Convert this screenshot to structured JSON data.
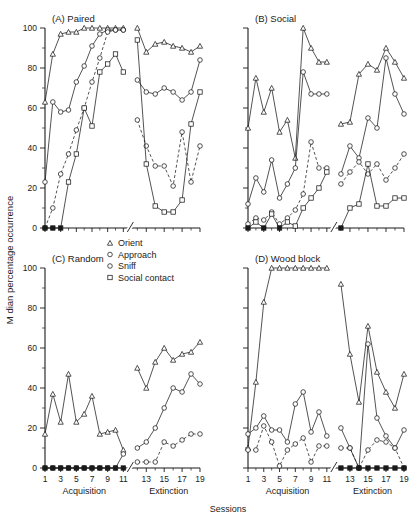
{
  "figure": {
    "y_axis_label": "M dian percentage occurrence",
    "x_axis_label": "Sessions",
    "phase_labels": {
      "acquisition": "Acquisition",
      "extinction": "Extinction"
    },
    "y_ticks": [
      "0",
      "20",
      "40",
      "60",
      "80",
      "100"
    ],
    "x_ticks_acquisition": [
      "1",
      "3",
      "5",
      "7",
      "9",
      "11"
    ],
    "x_ticks_extinction": [
      "13",
      "15",
      "17",
      "19"
    ]
  },
  "legend": {
    "items": [
      {
        "label": "Orient",
        "marker": "triangle",
        "style": "solid"
      },
      {
        "label": "Approach",
        "marker": "circle",
        "style": "solid"
      },
      {
        "label": "Sniff",
        "marker": "circle",
        "style": "solid"
      },
      {
        "label": "Social contact",
        "marker": "square",
        "style": "solid"
      }
    ]
  },
  "panels": {
    "a": {
      "title": "(A) Paired"
    },
    "b": {
      "title": "(B) Social"
    },
    "c": {
      "title": "(C) Random"
    },
    "d": {
      "title": "(D) Wood block"
    }
  },
  "chart_data": [
    {
      "id": "A",
      "type": "line",
      "title": "(A) Paired",
      "xlabel": "Sessions",
      "ylabel": "M dian percentage occurrence",
      "ylim": [
        0,
        100
      ],
      "xlim": [
        1,
        19
      ],
      "grid": false,
      "axis_break_between": [
        11,
        12
      ],
      "phases": {
        "acquisition": [
          1,
          11
        ],
        "extinction": [
          12,
          19
        ]
      },
      "series": [
        {
          "name": "Orient",
          "marker": "triangle",
          "style": "solid",
          "x": [
            1,
            2,
            3,
            4,
            5,
            6,
            7,
            8,
            9,
            10,
            11,
            12,
            13,
            14,
            15,
            16,
            17,
            18,
            19
          ],
          "y": [
            63,
            87,
            97,
            98,
            98,
            100,
            100,
            100,
            100,
            100,
            100,
            100,
            88,
            92,
            93,
            91,
            90,
            88,
            91
          ]
        },
        {
          "name": "Approach",
          "marker": "circle",
          "style": "solid",
          "x": [
            1,
            2,
            3,
            4,
            5,
            6,
            7,
            8,
            9,
            10,
            11,
            12,
            13,
            14,
            15,
            16,
            17,
            18,
            19
          ],
          "y": [
            23,
            63,
            58,
            59,
            73,
            81,
            91,
            97,
            99,
            99,
            99,
            74,
            68,
            67,
            70,
            68,
            64,
            68,
            84
          ]
        },
        {
          "name": "Sniff",
          "marker": "circle",
          "style": "dashed",
          "x": [
            1,
            2,
            3,
            4,
            5,
            6,
            7,
            8,
            9,
            10,
            11,
            12,
            13,
            14,
            15,
            16,
            17,
            18,
            19
          ],
          "y": [
            0,
            10,
            27,
            37,
            49,
            60,
            73,
            85,
            98,
            99,
            99,
            54,
            41,
            31,
            31,
            21,
            48,
            23,
            41
          ]
        },
        {
          "name": "Social contact",
          "marker": "square",
          "style": "solid",
          "x": [
            1,
            2,
            3,
            4,
            5,
            6,
            7,
            8,
            9,
            10,
            11,
            12,
            13,
            14,
            15,
            16,
            17,
            18,
            19
          ],
          "y": [
            0,
            0,
            0,
            23,
            37,
            60,
            51,
            78,
            82,
            87,
            78,
            94,
            32,
            11,
            8,
            8,
            14,
            52,
            68
          ]
        }
      ]
    },
    {
      "id": "B",
      "type": "line",
      "title": "(B) Social",
      "xlabel": "Sessions",
      "ylabel": "M dian percentage occurrence",
      "ylim": [
        0,
        100
      ],
      "xlim": [
        1,
        19
      ],
      "grid": false,
      "axis_break_between": [
        11,
        12
      ],
      "phases": {
        "acquisition": [
          1,
          11
        ],
        "extinction": [
          12,
          19
        ]
      },
      "series": [
        {
          "name": "Orient",
          "marker": "triangle",
          "style": "solid",
          "x": [
            1,
            2,
            3,
            4,
            5,
            6,
            7,
            8,
            9,
            10,
            11,
            12,
            13,
            14,
            15,
            16,
            17,
            18,
            19
          ],
          "y": [
            50,
            75,
            58,
            70,
            48,
            54,
            35,
            100,
            90,
            83,
            83,
            52,
            53,
            77,
            82,
            79,
            90,
            83,
            75
          ]
        },
        {
          "name": "Approach",
          "marker": "circle",
          "style": "solid",
          "x": [
            1,
            2,
            3,
            4,
            5,
            6,
            7,
            8,
            9,
            10,
            11,
            12,
            13,
            14,
            15,
            16,
            17,
            18,
            19
          ],
          "y": [
            12,
            25,
            18,
            34,
            15,
            22,
            30,
            78,
            67,
            67,
            67,
            27,
            41,
            35,
            55,
            50,
            85,
            67,
            57
          ]
        },
        {
          "name": "Sniff",
          "marker": "circle",
          "style": "dashed",
          "x": [
            1,
            2,
            3,
            4,
            5,
            6,
            7,
            8,
            9,
            10,
            11,
            12,
            13,
            14,
            15,
            16,
            17,
            18,
            19
          ],
          "y": [
            2,
            5,
            4,
            8,
            2,
            5,
            9,
            17,
            43,
            30,
            30,
            22,
            28,
            33,
            27,
            32,
            24,
            30,
            37
          ]
        },
        {
          "name": "Social contact",
          "marker": "square",
          "style": "solid",
          "x": [
            1,
            2,
            3,
            4,
            5,
            6,
            7,
            8,
            9,
            10,
            11,
            12,
            13,
            14,
            15,
            16,
            17,
            18,
            19
          ],
          "y": [
            0,
            3,
            0,
            7,
            0,
            3,
            1,
            10,
            15,
            20,
            28,
            0,
            10,
            12,
            32,
            11,
            11,
            15,
            15
          ]
        }
      ]
    },
    {
      "id": "C",
      "type": "line",
      "title": "(C) Random",
      "xlabel": "Sessions",
      "ylabel": "M dian percentage occurrence",
      "ylim": [
        0,
        100
      ],
      "xlim": [
        1,
        19
      ],
      "grid": false,
      "axis_break_between": [
        11,
        12
      ],
      "phases": {
        "acquisition": [
          1,
          11
        ],
        "extinction": [
          12,
          19
        ]
      },
      "series": [
        {
          "name": "Orient",
          "marker": "triangle",
          "style": "solid",
          "x": [
            1,
            2,
            3,
            4,
            5,
            6,
            7,
            8,
            9,
            10,
            11,
            12,
            13,
            14,
            15,
            16,
            17,
            18,
            19
          ],
          "y": [
            17,
            37,
            23,
            47,
            23,
            27,
            36,
            17,
            18,
            19,
            9,
            50,
            40,
            53,
            60,
            54,
            57,
            58,
            63
          ]
        },
        {
          "name": "Approach",
          "marker": "circle",
          "style": "solid",
          "x": [
            1,
            2,
            3,
            4,
            5,
            6,
            7,
            8,
            9,
            10,
            11,
            12,
            13,
            14,
            15,
            16,
            17,
            18,
            19
          ],
          "y": [
            0,
            0,
            0,
            0,
            0,
            0,
            0,
            0,
            0,
            0,
            7,
            10,
            13,
            20,
            30,
            40,
            38,
            47,
            42
          ]
        },
        {
          "name": "Sniff",
          "marker": "circle",
          "style": "dashed",
          "x": [
            12,
            13,
            14,
            15,
            16,
            17,
            18,
            19
          ],
          "y": [
            3,
            3,
            3,
            13,
            11,
            14,
            17,
            17
          ]
        },
        {
          "name": "Social contact",
          "marker": "square",
          "style": "solid",
          "x": [
            1,
            2,
            3,
            4,
            5,
            6,
            7,
            8,
            9,
            10,
            11
          ],
          "y": [
            0,
            0,
            0,
            0,
            0,
            0,
            0,
            0,
            0,
            0,
            0
          ]
        }
      ]
    },
    {
      "id": "D",
      "type": "line",
      "title": "(D) Wood block",
      "xlabel": "Sessions",
      "ylabel": "M dian percentage occurrence",
      "ylim": [
        0,
        100
      ],
      "xlim": [
        1,
        19
      ],
      "grid": false,
      "axis_break_between": [
        11,
        12
      ],
      "phases": {
        "acquisition": [
          1,
          11
        ],
        "extinction": [
          12,
          19
        ]
      },
      "series": [
        {
          "name": "Orient",
          "marker": "triangle",
          "style": "solid",
          "x": [
            1,
            2,
            3,
            4,
            5,
            6,
            7,
            8,
            9,
            10,
            11,
            12,
            13,
            14,
            15,
            16,
            17,
            18,
            19
          ],
          "y": [
            10,
            43,
            83,
            100,
            100,
            100,
            100,
            100,
            100,
            100,
            100,
            92,
            57,
            33,
            71,
            48,
            38,
            30,
            47
          ]
        },
        {
          "name": "Approach",
          "marker": "circle",
          "style": "solid",
          "x": [
            1,
            2,
            3,
            4,
            5,
            6,
            7,
            8,
            9,
            10,
            11,
            12,
            13,
            14,
            15,
            16,
            17,
            18,
            19
          ],
          "y": [
            17,
            20,
            26,
            19,
            19,
            13,
            32,
            38,
            18,
            28,
            16,
            20,
            10,
            0,
            62,
            25,
            16,
            10,
            19
          ]
        },
        {
          "name": "Sniff",
          "marker": "circle",
          "style": "dashed",
          "x": [
            1,
            2,
            3,
            4,
            5,
            6,
            7,
            8,
            9,
            10,
            11,
            12,
            13,
            14,
            15,
            16,
            17,
            18,
            19
          ],
          "y": [
            9,
            9,
            21,
            13,
            1,
            9,
            12,
            15,
            3,
            11,
            11,
            10,
            10,
            0,
            9,
            14,
            13,
            10,
            0
          ]
        },
        {
          "name": "Social contact",
          "marker": "square",
          "style": "solid",
          "x": [
            12,
            13,
            14,
            15,
            16,
            17,
            18,
            19
          ],
          "y": [
            0,
            0,
            0,
            0,
            0,
            0,
            0,
            0
          ]
        }
      ]
    }
  ]
}
